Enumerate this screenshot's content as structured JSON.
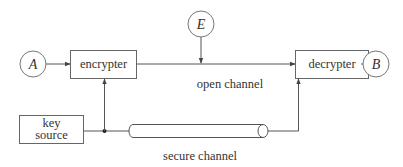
{
  "diagram": {
    "nodes": {
      "alice": {
        "label": "A"
      },
      "bob": {
        "label": "B"
      },
      "eve": {
        "label": "E"
      },
      "encrypter": {
        "label": "encrypter"
      },
      "decrypter": {
        "label": "decrypter"
      },
      "key_source": {
        "label_line1": "key",
        "label_line2": "source"
      }
    },
    "channels": {
      "open": {
        "label": "open channel"
      },
      "secure": {
        "label": "secure channel"
      }
    },
    "edges": [
      {
        "from": "A",
        "to": "encrypter"
      },
      {
        "from": "encrypter",
        "to": "decrypter",
        "via": "open channel"
      },
      {
        "from": "E",
        "to": "open channel"
      },
      {
        "from": "decrypter",
        "to": "B"
      },
      {
        "from": "key source",
        "to": "encrypter"
      },
      {
        "from": "key source",
        "to": "decrypter",
        "via": "secure channel"
      }
    ],
    "colors": {
      "line": "#555555",
      "background": "#ffffff",
      "text": "#333333"
    }
  }
}
